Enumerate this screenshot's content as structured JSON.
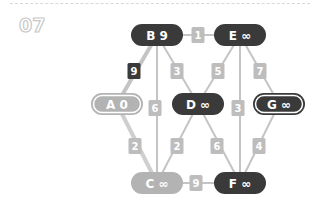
{
  "header": {
    "step_number": "07"
  },
  "colors": {
    "dark": "#3a3a3a",
    "light": "#b3b3b3",
    "edge_light": "#c4c4c4",
    "edge_dark": "#4a4a4a",
    "label_light": "#bdbdbd",
    "label_dark": "#3a3a3a"
  },
  "nodes": [
    {
      "id": "B",
      "label": "B 9",
      "x": 157,
      "y": 35,
      "style": "dark"
    },
    {
      "id": "E",
      "label": "E ∞",
      "x": 240,
      "y": 35,
      "style": "dark"
    },
    {
      "id": "A",
      "label": "A 0",
      "x": 117,
      "y": 104,
      "style": "light-outlined"
    },
    {
      "id": "D",
      "label": "D ∞",
      "x": 198,
      "y": 104,
      "style": "dark"
    },
    {
      "id": "G",
      "label": "G ∞",
      "x": 279,
      "y": 104,
      "style": "dark-outlined"
    },
    {
      "id": "C",
      "label": "C ∞",
      "x": 157,
      "y": 183,
      "style": "light"
    },
    {
      "id": "F",
      "label": "F ∞",
      "x": 240,
      "y": 183,
      "style": "dark"
    }
  ],
  "edges": [
    {
      "from": "B",
      "to": "E",
      "weight": "1",
      "style": "light"
    },
    {
      "from": "A",
      "to": "B",
      "weight": "9",
      "style": "dark"
    },
    {
      "from": "B",
      "to": "D",
      "weight": "3",
      "style": "light"
    },
    {
      "from": "B",
      "to": "C",
      "weight": "6",
      "style": "light"
    },
    {
      "from": "E",
      "to": "D",
      "weight": "5",
      "style": "light"
    },
    {
      "from": "E",
      "to": "F",
      "weight": "3",
      "style": "light"
    },
    {
      "from": "E",
      "to": "G",
      "weight": "7",
      "style": "light"
    },
    {
      "from": "A",
      "to": "C",
      "weight": "2",
      "style": "light-thick"
    },
    {
      "from": "D",
      "to": "C",
      "weight": "2",
      "style": "light"
    },
    {
      "from": "D",
      "to": "F",
      "weight": "6",
      "style": "light"
    },
    {
      "from": "G",
      "to": "F",
      "weight": "4",
      "style": "light"
    },
    {
      "from": "C",
      "to": "F",
      "weight": "9",
      "style": "light"
    }
  ],
  "edge_label_positions": [
    {
      "x": 198,
      "y": 35
    },
    {
      "x": 134,
      "y": 71
    },
    {
      "x": 177,
      "y": 71
    },
    {
      "x": 155,
      "y": 108
    },
    {
      "x": 218,
      "y": 71
    },
    {
      "x": 238,
      "y": 108
    },
    {
      "x": 260,
      "y": 71
    },
    {
      "x": 135,
      "y": 146
    },
    {
      "x": 177,
      "y": 146
    },
    {
      "x": 217,
      "y": 146
    },
    {
      "x": 259,
      "y": 146
    },
    {
      "x": 196,
      "y": 183
    }
  ]
}
